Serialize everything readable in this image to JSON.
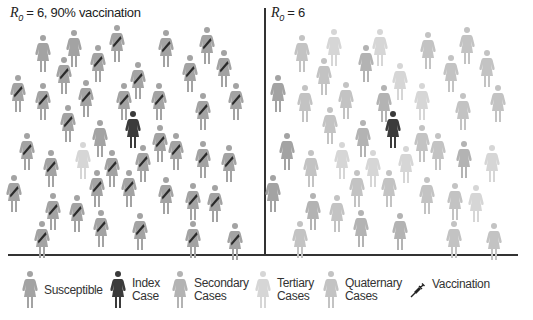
{
  "colors": {
    "susceptible": "#a3a3a3",
    "index": "#3b3b3b",
    "secondary": "#b3b3b3",
    "tertiary": "#d6d6d6",
    "quaternary": "#c3c3c3",
    "sash": "#2a2a2a",
    "line": "#333333"
  },
  "panels": [
    {
      "title_prefix": "R",
      "title_sub": "0",
      "title_suffix": " = 6, 90% vaccination",
      "figures": [
        {
          "x": 43,
          "y": 30,
          "t": "susceptible",
          "v": false
        },
        {
          "x": 74,
          "y": 25,
          "t": "susceptible",
          "v": false
        },
        {
          "x": 117,
          "y": 20,
          "t": "susceptible",
          "v": true
        },
        {
          "x": 98,
          "y": 40,
          "t": "susceptible",
          "v": true
        },
        {
          "x": 64,
          "y": 52,
          "t": "susceptible",
          "v": true
        },
        {
          "x": 166,
          "y": 25,
          "t": "susceptible",
          "v": true
        },
        {
          "x": 207,
          "y": 22,
          "t": "susceptible",
          "v": true
        },
        {
          "x": 190,
          "y": 50,
          "t": "susceptible",
          "v": true
        },
        {
          "x": 224,
          "y": 45,
          "t": "susceptible",
          "v": true
        },
        {
          "x": 138,
          "y": 57,
          "t": "susceptible",
          "v": true
        },
        {
          "x": 18,
          "y": 70,
          "t": "susceptible",
          "v": true
        },
        {
          "x": 43,
          "y": 78,
          "t": "susceptible",
          "v": true
        },
        {
          "x": 86,
          "y": 75,
          "t": "susceptible",
          "v": true
        },
        {
          "x": 124,
          "y": 78,
          "t": "susceptible",
          "v": true
        },
        {
          "x": 159,
          "y": 78,
          "t": "susceptible",
          "v": true
        },
        {
          "x": 203,
          "y": 88,
          "t": "susceptible",
          "v": true
        },
        {
          "x": 236,
          "y": 78,
          "t": "susceptible",
          "v": true
        },
        {
          "x": 68,
          "y": 100,
          "t": "susceptible",
          "v": true
        },
        {
          "x": 100,
          "y": 115,
          "t": "susceptible",
          "v": false
        },
        {
          "x": 133,
          "y": 106,
          "t": "index",
          "v": false
        },
        {
          "x": 160,
          "y": 120,
          "t": "susceptible",
          "v": true
        },
        {
          "x": 176,
          "y": 128,
          "t": "susceptible",
          "v": true
        },
        {
          "x": 27,
          "y": 128,
          "t": "susceptible",
          "v": true
        },
        {
          "x": 51,
          "y": 145,
          "t": "susceptible",
          "v": true
        },
        {
          "x": 83,
          "y": 137,
          "t": "tertiary",
          "v": false
        },
        {
          "x": 112,
          "y": 145,
          "t": "susceptible",
          "v": true
        },
        {
          "x": 143,
          "y": 140,
          "t": "susceptible",
          "v": true
        },
        {
          "x": 203,
          "y": 136,
          "t": "susceptible",
          "v": true
        },
        {
          "x": 229,
          "y": 140,
          "t": "susceptible",
          "v": true
        },
        {
          "x": 14,
          "y": 170,
          "t": "susceptible",
          "v": true
        },
        {
          "x": 97,
          "y": 165,
          "t": "susceptible",
          "v": true
        },
        {
          "x": 129,
          "y": 165,
          "t": "susceptible",
          "v": true
        },
        {
          "x": 166,
          "y": 172,
          "t": "susceptible",
          "v": true
        },
        {
          "x": 193,
          "y": 178,
          "t": "susceptible",
          "v": true
        },
        {
          "x": 215,
          "y": 180,
          "t": "susceptible",
          "v": true
        },
        {
          "x": 53,
          "y": 188,
          "t": "susceptible",
          "v": true
        },
        {
          "x": 77,
          "y": 190,
          "t": "susceptible",
          "v": true
        },
        {
          "x": 101,
          "y": 205,
          "t": "susceptible",
          "v": true
        },
        {
          "x": 140,
          "y": 208,
          "t": "susceptible",
          "v": true
        },
        {
          "x": 193,
          "y": 216,
          "t": "susceptible",
          "v": true
        },
        {
          "x": 235,
          "y": 218,
          "t": "susceptible",
          "v": true
        },
        {
          "x": 42,
          "y": 216,
          "t": "susceptible",
          "v": true
        }
      ]
    },
    {
      "title_prefix": "R",
      "title_sub": "0",
      "title_suffix": " = 6",
      "figures": [
        {
          "x": 302,
          "y": 30,
          "t": "quaternary",
          "v": false
        },
        {
          "x": 334,
          "y": 24,
          "t": "tertiary",
          "v": false
        },
        {
          "x": 380,
          "y": 24,
          "t": "tertiary",
          "v": false
        },
        {
          "x": 366,
          "y": 40,
          "t": "secondary",
          "v": false
        },
        {
          "x": 324,
          "y": 53,
          "t": "quaternary",
          "v": false
        },
        {
          "x": 428,
          "y": 27,
          "t": "quaternary",
          "v": false
        },
        {
          "x": 467,
          "y": 22,
          "t": "quaternary",
          "v": false
        },
        {
          "x": 451,
          "y": 50,
          "t": "quaternary",
          "v": false
        },
        {
          "x": 487,
          "y": 45,
          "t": "quaternary",
          "v": false
        },
        {
          "x": 400,
          "y": 58,
          "t": "tertiary",
          "v": false
        },
        {
          "x": 278,
          "y": 70,
          "t": "susceptible",
          "v": false
        },
        {
          "x": 305,
          "y": 80,
          "t": "quaternary",
          "v": false
        },
        {
          "x": 346,
          "y": 77,
          "t": "quaternary",
          "v": false
        },
        {
          "x": 384,
          "y": 80,
          "t": "secondary",
          "v": false
        },
        {
          "x": 422,
          "y": 78,
          "t": "tertiary",
          "v": false
        },
        {
          "x": 463,
          "y": 88,
          "t": "quaternary",
          "v": false
        },
        {
          "x": 498,
          "y": 80,
          "t": "quaternary",
          "v": false
        },
        {
          "x": 330,
          "y": 102,
          "t": "quaternary",
          "v": false
        },
        {
          "x": 363,
          "y": 115,
          "t": "secondary",
          "v": false
        },
        {
          "x": 393,
          "y": 106,
          "t": "index",
          "v": false
        },
        {
          "x": 422,
          "y": 120,
          "t": "quaternary",
          "v": false
        },
        {
          "x": 438,
          "y": 128,
          "t": "quaternary",
          "v": false
        },
        {
          "x": 287,
          "y": 128,
          "t": "susceptible",
          "v": false
        },
        {
          "x": 311,
          "y": 145,
          "t": "quaternary",
          "v": false
        },
        {
          "x": 342,
          "y": 137,
          "t": "tertiary",
          "v": false
        },
        {
          "x": 373,
          "y": 145,
          "t": "tertiary",
          "v": false
        },
        {
          "x": 406,
          "y": 141,
          "t": "tertiary",
          "v": false
        },
        {
          "x": 464,
          "y": 136,
          "t": "secondary",
          "v": false
        },
        {
          "x": 492,
          "y": 140,
          "t": "tertiary",
          "v": false
        },
        {
          "x": 273,
          "y": 170,
          "t": "susceptible",
          "v": false
        },
        {
          "x": 357,
          "y": 165,
          "t": "quaternary",
          "v": false
        },
        {
          "x": 389,
          "y": 165,
          "t": "quaternary",
          "v": false
        },
        {
          "x": 427,
          "y": 172,
          "t": "quaternary",
          "v": false
        },
        {
          "x": 455,
          "y": 178,
          "t": "quaternary",
          "v": false
        },
        {
          "x": 476,
          "y": 180,
          "t": "tertiary",
          "v": false
        },
        {
          "x": 313,
          "y": 188,
          "t": "secondary",
          "v": false
        },
        {
          "x": 337,
          "y": 190,
          "t": "quaternary",
          "v": false
        },
        {
          "x": 361,
          "y": 205,
          "t": "secondary",
          "v": false
        },
        {
          "x": 400,
          "y": 208,
          "t": "secondary",
          "v": false
        },
        {
          "x": 454,
          "y": 216,
          "t": "quaternary",
          "v": false
        },
        {
          "x": 494,
          "y": 218,
          "t": "quaternary",
          "v": false
        },
        {
          "x": 300,
          "y": 216,
          "t": "quaternary",
          "v": false
        }
      ]
    }
  ],
  "legend": [
    {
      "key": "susceptible",
      "label_line1": "Susceptible",
      "label_line2": "",
      "icon": "person-icon",
      "x": 22
    },
    {
      "key": "index",
      "label_line1": "Index",
      "label_line2": "Case",
      "icon": "person-icon",
      "x": 110
    },
    {
      "key": "secondary",
      "label_line1": "Secondary",
      "label_line2": "Cases",
      "icon": "person-icon",
      "x": 172
    },
    {
      "key": "tertiary",
      "label_line1": "Tertiary",
      "label_line2": "Cases",
      "icon": "person-icon",
      "x": 255
    },
    {
      "key": "quaternary",
      "label_line1": "Quaternary",
      "label_line2": "Cases",
      "icon": "person-icon",
      "x": 323
    },
    {
      "key": "vaccination",
      "label_line1": "Vaccination",
      "label_line2": "",
      "icon": "syringe-icon",
      "x": 410
    }
  ]
}
